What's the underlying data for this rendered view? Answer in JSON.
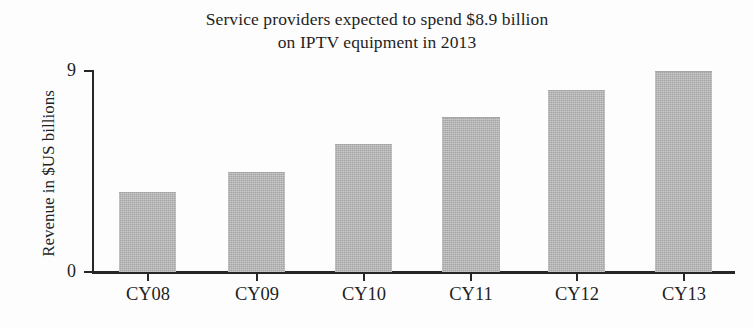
{
  "chart_data": {
    "type": "bar",
    "title": "Service providers expected to spend $8.9 billion on IPTV equipment in 2013",
    "title_lines": [
      "Service providers expected to spend $8.9 billion",
      "on IPTV equipment in 2013"
    ],
    "categories": [
      "CY08",
      "CY09",
      "CY10",
      "CY11",
      "CY12",
      "CY13"
    ],
    "values": [
      3.55,
      4.45,
      5.7,
      6.9,
      8.1,
      8.95
    ],
    "xlabel": "",
    "ylabel": "Revenue in $US billions",
    "ylim": [
      0,
      9
    ],
    "ytick_labels": [
      "0",
      "9"
    ],
    "ytick_values": [
      0,
      9
    ],
    "grid": false,
    "legend": false,
    "bar_color": "#b5b5b5",
    "axis_color": "#262626",
    "text_color": "#1f1f1f",
    "background_color": "#fdfdfd"
  }
}
